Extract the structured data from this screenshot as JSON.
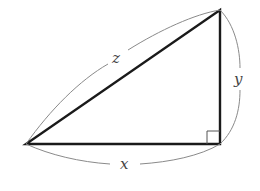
{
  "diagram": {
    "type": "right-triangle",
    "labels": {
      "hypotenuse": "z",
      "vertical_leg": "y",
      "horizontal_leg": "x"
    },
    "right_angle_marker": true,
    "colors": {
      "triangle_stroke": "#1a1a1a",
      "brace_stroke": "#8a8a8a",
      "label": "#444444"
    }
  }
}
